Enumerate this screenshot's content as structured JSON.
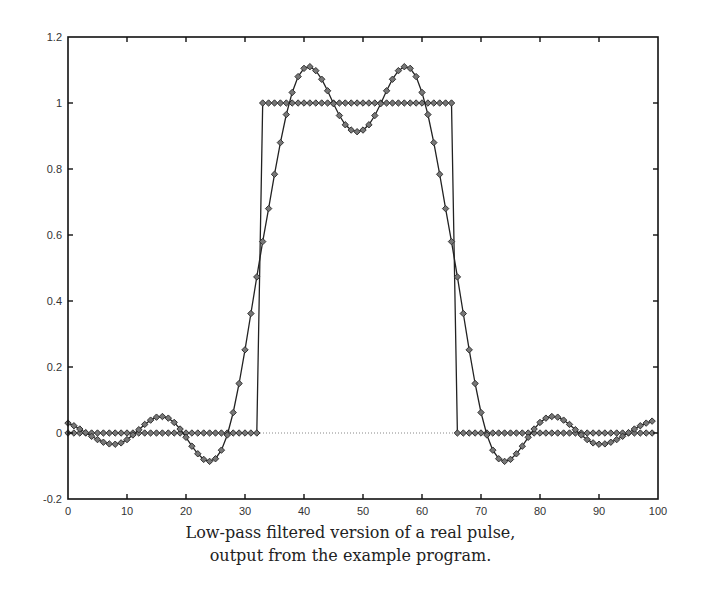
{
  "caption": {
    "line1": "Low-pass filtered version of a real pulse,",
    "line2": "output from the example program."
  },
  "colors": {
    "axis": "#111111",
    "series": "#222222",
    "marker": "#333333",
    "zero_line": "#888888",
    "tick_text": "#333333"
  },
  "chart_data": {
    "type": "line",
    "title": "",
    "caption": "Low-pass filtered version of a real pulse, output from the example program.",
    "xlabel": "",
    "ylabel": "",
    "xlim": [
      0,
      100
    ],
    "ylim": [
      -0.2,
      1.2
    ],
    "xticks": [
      0,
      10,
      20,
      30,
      40,
      50,
      60,
      70,
      80,
      90,
      100
    ],
    "yticks": [
      -0.2,
      0,
      0.2,
      0.4,
      0.6,
      0.8,
      1,
      1.2
    ],
    "ytick_labels": [
      "-0.2",
      "0",
      "0.2",
      "0.4",
      "0.6",
      "0.8",
      "1",
      "1.2"
    ],
    "xtick_labels": [
      "0",
      "10",
      "20",
      "30",
      "40",
      "50",
      "60",
      "70",
      "80",
      "90",
      "100"
    ],
    "grid": false,
    "legend": null,
    "zero_reference_line": {
      "y": 0,
      "style": "dotted"
    },
    "marker": "diamond",
    "series": [
      {
        "name": "original pulse",
        "style": "step",
        "x_start": 0,
        "values": [
          0,
          0,
          0,
          0,
          0,
          0,
          0,
          0,
          0,
          0,
          0,
          0,
          0,
          0,
          0,
          0,
          0,
          0,
          0,
          0,
          0,
          0,
          0,
          0,
          0,
          0,
          0,
          0,
          0,
          0,
          0,
          0,
          0,
          1,
          1,
          1,
          1,
          1,
          1,
          1,
          1,
          1,
          1,
          1,
          1,
          1,
          1,
          1,
          1,
          1,
          1,
          1,
          1,
          1,
          1,
          1,
          1,
          1,
          1,
          1,
          1,
          1,
          1,
          1,
          1,
          1,
          0,
          0,
          0,
          0,
          0,
          0,
          0,
          0,
          0,
          0,
          0,
          0,
          0,
          0,
          0,
          0,
          0,
          0,
          0,
          0,
          0,
          0,
          0,
          0,
          0,
          0,
          0,
          0,
          0,
          0,
          0,
          0,
          0,
          0
        ]
      },
      {
        "name": "low-pass filtered",
        "style": "line",
        "x_start": 0,
        "values": [
          0.03,
          0.022,
          0.012,
          0.001,
          -0.01,
          -0.02,
          -0.028,
          -0.033,
          -0.034,
          -0.03,
          -0.02,
          -0.006,
          0.01,
          0.026,
          0.039,
          0.048,
          0.05,
          0.045,
          0.032,
          0.012,
          -0.013,
          -0.04,
          -0.063,
          -0.08,
          -0.086,
          -0.078,
          -0.052,
          -0.006,
          0.062,
          0.15,
          0.252,
          0.362,
          0.473,
          0.58,
          0.68,
          0.784,
          0.88,
          0.965,
          1.032,
          1.08,
          1.105,
          1.11,
          1.098,
          1.072,
          1.037,
          0.998,
          0.962,
          0.934,
          0.918,
          0.913,
          0.918,
          0.934,
          0.962,
          0.998,
          1.037,
          1.072,
          1.098,
          1.11,
          1.105,
          1.08,
          1.032,
          0.965,
          0.88,
          0.784,
          0.68,
          0.58,
          0.473,
          0.362,
          0.252,
          0.15,
          0.062,
          -0.006,
          -0.052,
          -0.078,
          -0.086,
          -0.08,
          -0.063,
          -0.04,
          -0.013,
          0.012,
          0.032,
          0.045,
          0.05,
          0.048,
          0.039,
          0.026,
          0.01,
          -0.006,
          -0.02,
          -0.03,
          -0.034,
          -0.033,
          -0.028,
          -0.02,
          -0.01,
          0.001,
          0.012,
          0.022,
          0.03,
          0.036
        ]
      }
    ]
  }
}
